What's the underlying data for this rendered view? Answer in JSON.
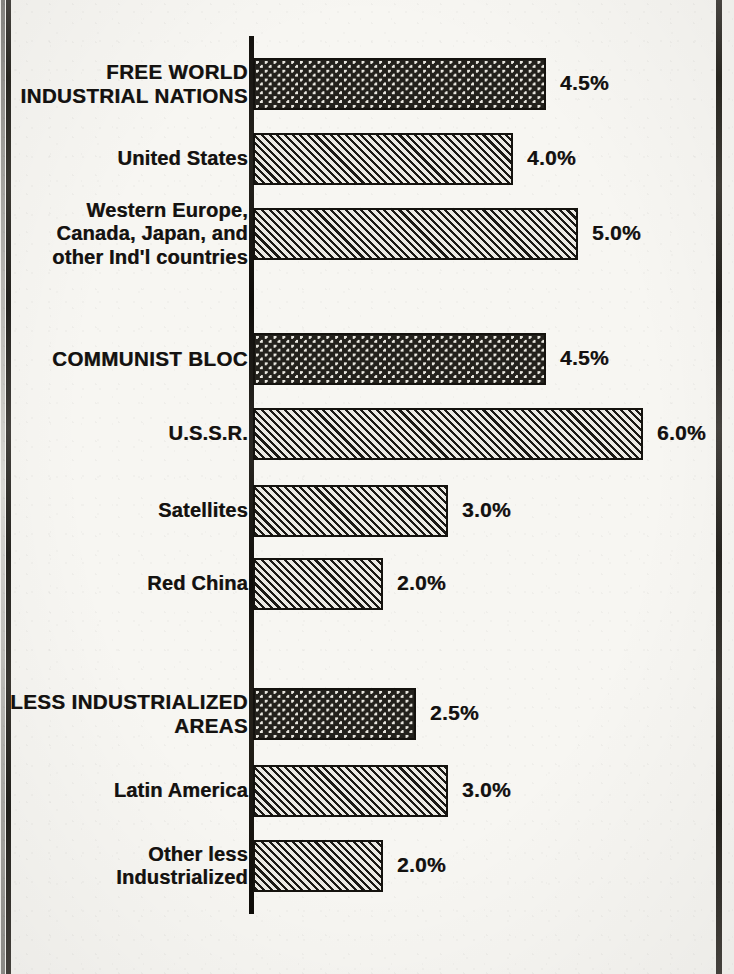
{
  "document": {
    "kind": "scanned-bar-chart",
    "background_color": "#f7f6f2",
    "ink_color": "#14120e"
  },
  "chart_data": {
    "type": "bar",
    "orientation": "horizontal",
    "title": "",
    "subtitle": "",
    "xlabel": "",
    "ylabel": "",
    "value_suffix": "%",
    "xlim": [
      0,
      6.5
    ],
    "grid": false,
    "legend": "none",
    "axis_position": "left",
    "categories": [
      "FREE WORLD\nINDUSTRIAL NATIONS",
      "United States",
      "Western Europe,\nCanada, Japan, and\nother Ind'l countries",
      "COMMUNIST BLOC",
      "U.S.S.R.",
      "Satellites",
      "Red China",
      "LESS INDUSTRIALIZED\nAREAS",
      "Latin America",
      "Other less\nIndustrialized"
    ],
    "values": [
      4.5,
      4.0,
      5.0,
      4.5,
      6.0,
      3.0,
      2.0,
      2.5,
      3.0,
      2.0
    ],
    "value_labels": [
      "4.5%",
      "4.0%",
      "5.0%",
      "4.5%",
      "6.0%",
      "3.0%",
      "2.0%",
      "2.5%",
      "3.0%",
      "2.0%"
    ],
    "series": [
      {
        "name": "Annual growth rate",
        "values": [
          4.5,
          4.0,
          5.0,
          4.5,
          6.0,
          3.0,
          2.0,
          2.5,
          3.0,
          2.0
        ]
      }
    ],
    "bar_styles": [
      "dots",
      "hatch",
      "hatch",
      "dots",
      "hatch",
      "hatch",
      "hatch",
      "dots",
      "hatch",
      "hatch"
    ],
    "groups": [
      {
        "heading": "FREE WORLD\nINDUSTRIAL NATIONS",
        "members": [
          "United States",
          "Western Europe,\nCanada, Japan, and\nother Ind'l countries"
        ]
      },
      {
        "heading": "COMMUNIST BLOC",
        "members": [
          "U.S.S.R.",
          "Satellites",
          "Red China"
        ]
      },
      {
        "heading": "LESS INDUSTRIALIZED\nAREAS",
        "members": [
          "Latin America",
          "Other less\nIndustrialized"
        ]
      }
    ]
  },
  "rows": [
    {
      "id": "free-world-industrial-nations",
      "label": "FREE WORLD\nINDUSTRIAL NATIONS",
      "value": "4.5%",
      "kind": "group",
      "fill": "dots"
    },
    {
      "id": "united-states",
      "label": "United States",
      "value": "4.0%",
      "kind": "sub",
      "fill": "hatch"
    },
    {
      "id": "western-europe-canada-japan",
      "label": "Western Europe,\nCanada, Japan, and\nother Ind'l countries",
      "value": "5.0%",
      "kind": "sub",
      "fill": "hatch"
    },
    {
      "id": "communist-bloc",
      "label": "COMMUNIST BLOC",
      "value": "4.5%",
      "kind": "group",
      "fill": "dots"
    },
    {
      "id": "ussr",
      "label": "U.S.S.R.",
      "value": "6.0%",
      "kind": "sub",
      "fill": "hatch"
    },
    {
      "id": "satellites",
      "label": "Satellites",
      "value": "3.0%",
      "kind": "sub",
      "fill": "hatch"
    },
    {
      "id": "red-china",
      "label": "Red China",
      "value": "2.0%",
      "kind": "sub",
      "fill": "hatch"
    },
    {
      "id": "less-industrialized-areas",
      "label": "LESS INDUSTRIALIZED\nAREAS",
      "value": "2.5%",
      "kind": "group",
      "fill": "dots"
    },
    {
      "id": "latin-america",
      "label": "Latin America",
      "value": "3.0%",
      "kind": "sub",
      "fill": "hatch"
    },
    {
      "id": "other-less-industrialized",
      "label": "Other less\nIndustrialized",
      "value": "2.0%",
      "kind": "sub",
      "fill": "hatch"
    }
  ],
  "geometry": {
    "axis_x": 253,
    "px_per_percent": 65,
    "bar_height": 52,
    "value_gap": 14,
    "row_tops": [
      58,
      133,
      208,
      333,
      408,
      485,
      558,
      688,
      765,
      840
    ]
  }
}
